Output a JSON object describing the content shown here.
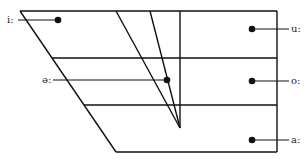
{
  "diagram": {
    "stroke_color": "#111111",
    "frame": {
      "top_left": [
        20,
        11
      ],
      "top_right": [
        277,
        11
      ],
      "bottom_right": [
        277,
        152
      ],
      "bottom_left": [
        116,
        152
      ]
    },
    "horizontal_lines_y": [
      58,
      105
    ],
    "center_vertical_x": 180,
    "converging_lines": [
      {
        "from": [
          116,
          11
        ],
        "to": [
          180,
          128
        ]
      },
      {
        "from": [
          150,
          11
        ],
        "to": [
          180,
          128
        ]
      }
    ],
    "vowels": [
      {
        "symbol": "i:",
        "dot": [
          58,
          20
        ],
        "label_side": "left",
        "label_x": 7,
        "label_y": 15
      },
      {
        "symbol": "ə:",
        "dot": [
          167,
          80
        ],
        "label_side": "left",
        "label_x": 42,
        "label_y": 75
      },
      {
        "symbol": "u:",
        "dot": [
          252,
          29
        ],
        "label_side": "right",
        "label_x": 291,
        "label_y": 24
      },
      {
        "symbol": "o:",
        "dot": [
          252,
          81
        ],
        "label_side": "right",
        "label_x": 291,
        "label_y": 76
      },
      {
        "symbol": "a:",
        "dot": [
          252,
          140
        ],
        "label_side": "right",
        "label_x": 291,
        "label_y": 135
      }
    ]
  }
}
